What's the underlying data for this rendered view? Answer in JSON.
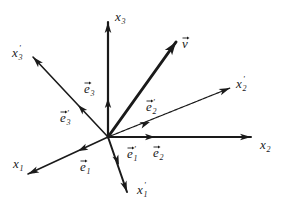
{
  "diagram": {
    "origin": [
      108,
      137
    ],
    "color": "#1a1a1a",
    "axes": [
      {
        "id": "x3",
        "label": "x",
        "sub": "3",
        "prime": false,
        "end": [
          108,
          22
        ],
        "labelPos": [
          115,
          21
        ],
        "unit_arrow_at": [
          108,
          98
        ],
        "width": 2.2
      },
      {
        "id": "v",
        "label": "v",
        "sub": "",
        "prime": false,
        "vector": true,
        "end": [
          176,
          42
        ],
        "labelPos": [
          182,
          48
        ],
        "width": 3
      },
      {
        "id": "x3p",
        "label": "x",
        "sub": "3",
        "prime": true,
        "end": [
          33,
          57
        ],
        "labelPos": [
          12,
          57
        ],
        "unit_arrow_at": [
          78,
          105
        ],
        "width": 1.6
      },
      {
        "id": "x2p",
        "label": "x",
        "sub": "2",
        "prime": true,
        "end": [
          230,
          88
        ],
        "labelPos": [
          236,
          88
        ],
        "unit_arrow_at": [
          150,
          122
        ],
        "width": 1.2,
        "dashed": true
      },
      {
        "id": "x2",
        "label": "x",
        "sub": "2",
        "prime": false,
        "end": [
          251,
          137
        ],
        "labelPos": [
          260,
          149
        ],
        "unit_arrow_at": [
          155,
          137
        ],
        "width": 2
      },
      {
        "id": "x1",
        "label": "x",
        "sub": "1",
        "prime": false,
        "end": [
          28,
          174
        ],
        "labelPos": [
          13,
          168
        ],
        "unit_arrow_at": [
          78,
          151
        ],
        "width": 1.6
      },
      {
        "id": "x1p",
        "label": "x",
        "sub": "1",
        "prime": true,
        "end": [
          127,
          192
        ],
        "labelPos": [
          137,
          194
        ],
        "unit_arrow_at": [
          119,
          165
        ],
        "width": 2
      }
    ],
    "basis_labels": [
      {
        "id": "e3",
        "label": "e",
        "sub": "3",
        "prime": false,
        "pos": [
          84,
          93
        ]
      },
      {
        "id": "e3p",
        "label": "e",
        "sub": "3",
        "prime": true,
        "pos": [
          60,
          122
        ]
      },
      {
        "id": "e2p",
        "label": "e",
        "sub": "2",
        "prime": true,
        "pos": [
          146,
          111
        ]
      },
      {
        "id": "e2",
        "label": "e",
        "sub": "2",
        "prime": false,
        "pos": [
          153,
          157
        ]
      },
      {
        "id": "e1p",
        "label": "e",
        "sub": "1",
        "prime": true,
        "pos": [
          127,
          158
        ]
      },
      {
        "id": "e1",
        "label": "e",
        "sub": "1",
        "prime": false,
        "pos": [
          80,
          171
        ]
      }
    ]
  }
}
